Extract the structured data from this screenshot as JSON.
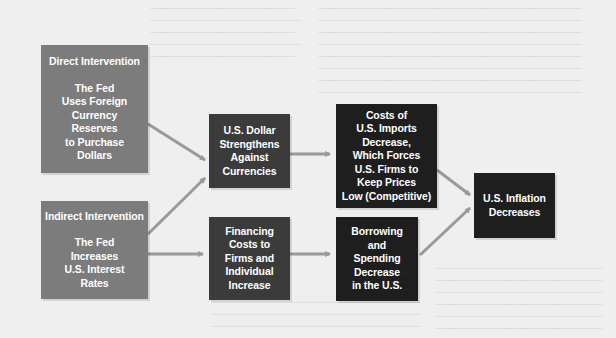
{
  "diagram": {
    "title": "",
    "colors": {
      "background": "#efefef",
      "source_box": "#7c7c7c",
      "intermediate_box": "#3b3b3b",
      "effect_box": "#1e1e1e",
      "arrow": "#9a9a9a",
      "text": "#ffffff"
    },
    "nodes": {
      "direct": {
        "heading": "Direct Intervention",
        "lines": [
          "The Fed",
          "Uses Foreign",
          "Currency",
          "Reserves",
          "to Purchase",
          "Dollars"
        ]
      },
      "indirect": {
        "heading": "Indirect Intervention",
        "lines": [
          "The Fed",
          "Increases",
          "U.S. Interest",
          "Rates"
        ]
      },
      "dollar": {
        "lines": [
          "U.S. Dollar",
          "Strengthens",
          "Against",
          "Currencies"
        ]
      },
      "financing": {
        "lines": [
          "Financing",
          "Costs to",
          "Firms and",
          "Individual",
          "Increase"
        ]
      },
      "imports": {
        "lines": [
          "Costs of",
          "U.S. Imports",
          "Decrease,",
          "Which Forces",
          "U.S. Firms to",
          "Keep Prices",
          "Low (Competitive)"
        ]
      },
      "borrowing": {
        "lines": [
          "Borrowing",
          "and",
          "Spending",
          "Decrease",
          "in the U.S."
        ]
      },
      "inflation": {
        "lines": [
          "U.S. Inflation",
          "Decreases"
        ]
      }
    },
    "edges": [
      {
        "from": "direct",
        "to": "dollar"
      },
      {
        "from": "indirect",
        "to": "dollar"
      },
      {
        "from": "indirect",
        "to": "financing"
      },
      {
        "from": "dollar",
        "to": "imports"
      },
      {
        "from": "financing",
        "to": "borrowing"
      },
      {
        "from": "imports",
        "to": "inflation"
      },
      {
        "from": "borrowing",
        "to": "inflation"
      }
    ]
  }
}
